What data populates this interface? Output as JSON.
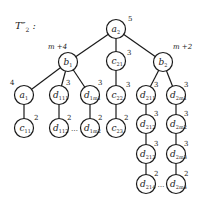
{
  "title": {
    "main": "T″",
    "sub": "2",
    "suffix": " :"
  },
  "nodes": [
    {
      "id": "a2",
      "base": "a",
      "sub": "2",
      "weight": "5"
    },
    {
      "id": "b1",
      "base": "b",
      "sub": "1",
      "weight": "m +4"
    },
    {
      "id": "c21",
      "base": "c",
      "sub": "21",
      "weight": "3"
    },
    {
      "id": "b2",
      "base": "b",
      "sub": "2",
      "weight": "m +2"
    },
    {
      "id": "a1",
      "base": "a",
      "sub": "1",
      "weight": "4"
    },
    {
      "id": "d111",
      "base": "d",
      "sub": "111",
      "weight": "3"
    },
    {
      "id": "d1m1",
      "base": "d",
      "sub": "1m1",
      "weight": "3"
    },
    {
      "id": "c22",
      "base": "c",
      "sub": "22",
      "weight": "3"
    },
    {
      "id": "c11",
      "base": "c",
      "sub": "11",
      "weight": "2"
    },
    {
      "id": "d112",
      "base": "d",
      "sub": "112",
      "weight": "2"
    },
    {
      "id": "d1m2",
      "base": "d",
      "sub": "1m2",
      "weight": "2"
    },
    {
      "id": "c23",
      "base": "c",
      "sub": "23",
      "weight": "2"
    },
    {
      "id": "d211",
      "base": "d",
      "sub": "211",
      "weight": "3"
    },
    {
      "id": "d2m1",
      "base": "d",
      "sub": "2m1",
      "weight": "3"
    },
    {
      "id": "d212",
      "base": "d",
      "sub": "212",
      "weight": "3"
    },
    {
      "id": "d2m2",
      "base": "d",
      "sub": "2m2",
      "weight": "3"
    },
    {
      "id": "d213",
      "base": "d",
      "sub": "213",
      "weight": "3"
    },
    {
      "id": "d2m3",
      "base": "d",
      "sub": "2m3",
      "weight": "3"
    },
    {
      "id": "d214",
      "base": "d",
      "sub": "214",
      "weight": "2"
    },
    {
      "id": "d2m4",
      "base": "d",
      "sub": "2m4",
      "weight": "2"
    }
  ],
  "edges": [
    [
      "a2",
      "b1"
    ],
    [
      "a2",
      "c21"
    ],
    [
      "a2",
      "b2"
    ],
    [
      "b1",
      "a1"
    ],
    [
      "b1",
      "d111"
    ],
    [
      "b1",
      "d1m1"
    ],
    [
      "a1",
      "c11"
    ],
    [
      "d111",
      "d112"
    ],
    [
      "d1m1",
      "d1m2"
    ],
    [
      "c21",
      "c22"
    ],
    [
      "c22",
      "c23"
    ],
    [
      "b2",
      "d211"
    ],
    [
      "b2",
      "d2m1"
    ],
    [
      "d211",
      "d212"
    ],
    [
      "d212",
      "d213"
    ],
    [
      "d213",
      "d214"
    ],
    [
      "d2m1",
      "d2m2"
    ],
    [
      "d2m2",
      "d2m3"
    ],
    [
      "d2m3",
      "d2m4"
    ]
  ],
  "ellipses": [
    {
      "between": [
        "d112",
        "d1m2"
      ],
      "text": "…"
    },
    {
      "between": [
        "d214",
        "d2m4"
      ],
      "text": "…"
    }
  ]
}
